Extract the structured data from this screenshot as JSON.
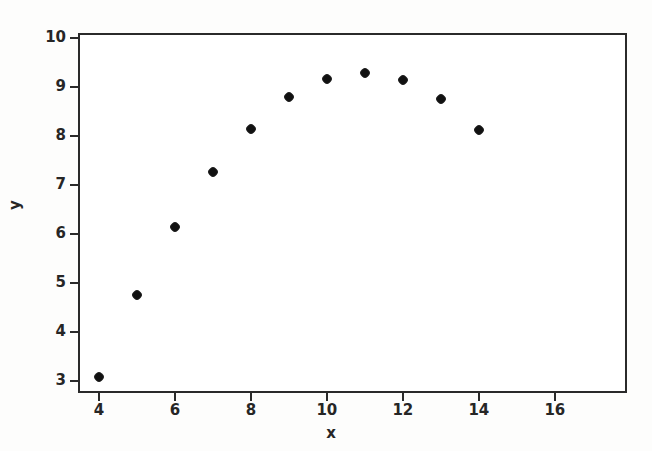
{
  "chart_data": {
    "type": "scatter",
    "title": "",
    "xlabel": "x",
    "ylabel": "y",
    "x": [
      4,
      5,
      6,
      7,
      8,
      9,
      10,
      11,
      12,
      13,
      14
    ],
    "y": [
      3.08,
      4.75,
      6.14,
      7.27,
      8.15,
      8.79,
      9.17,
      9.29,
      9.15,
      8.75,
      8.12
    ],
    "points": [
      {
        "x": 4,
        "y": 3.08
      },
      {
        "x": 5,
        "y": 4.75
      },
      {
        "x": 6,
        "y": 6.14
      },
      {
        "x": 7,
        "y": 7.27
      },
      {
        "x": 8,
        "y": 8.15
      },
      {
        "x": 9,
        "y": 8.79
      },
      {
        "x": 10,
        "y": 9.17
      },
      {
        "x": 11,
        "y": 9.29
      },
      {
        "x": 12,
        "y": 9.15
      },
      {
        "x": 13,
        "y": 8.75
      },
      {
        "x": 14,
        "y": 8.12
      }
    ],
    "xlim": [
      3.45,
      17.9
    ],
    "ylim": [
      2.75,
      10.1
    ],
    "xticks": [
      4,
      6,
      8,
      10,
      12,
      14,
      16
    ],
    "xticklabels": [
      "4",
      "6",
      "8",
      "10",
      "12",
      "14",
      "16"
    ],
    "yticks": [
      3,
      4,
      5,
      6,
      7,
      8,
      9,
      10
    ],
    "yticklabels": [
      "3",
      "4",
      "5",
      "6",
      "7",
      "8",
      "9",
      "10"
    ],
    "grid": false,
    "legend": null,
    "marker": "filled-circle",
    "marker_color": "#111111",
    "frame_color": "#2a2a2a",
    "background_color": "#ffffff"
  }
}
